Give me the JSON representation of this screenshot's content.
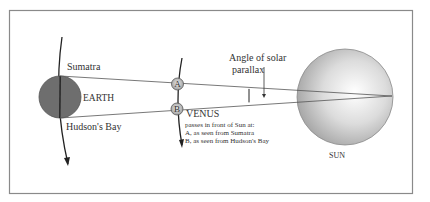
{
  "diagram": {
    "earth": {
      "label": "EARTH",
      "color": "#6e6e6e"
    },
    "sun": {
      "label": "SUN"
    },
    "observers": {
      "top": "Sumatra",
      "bottom": "Hudson's Bay"
    },
    "venus": {
      "label": "VENUS",
      "marker_a": "A",
      "marker_b": "B",
      "caption_line1": "passes in front of Sun at:",
      "caption_line2": "A, as seen from Sumatra",
      "caption_line3": "B, as seen from Hudson's Bay"
    },
    "angle": {
      "line1": "Angle of solar",
      "line2": "parallax"
    },
    "colors": {
      "frame": "#888888",
      "line": "#555555",
      "text": "#333333"
    }
  }
}
